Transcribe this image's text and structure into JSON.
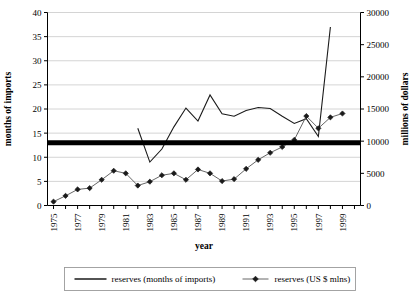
{
  "chart_data": {
    "type": "line",
    "title": "",
    "xlabel": "year",
    "ylabel_left": "months of imports",
    "ylabel_right": "millions of dollars",
    "grid": true,
    "legend_position": "bottom",
    "x": [
      1975,
      1976,
      1977,
      1978,
      1979,
      1980,
      1981,
      1982,
      1983,
      1984,
      1985,
      1986,
      1987,
      1988,
      1989,
      1990,
      1991,
      1992,
      1993,
      1994,
      1995,
      1996,
      1997,
      1998,
      1999
    ],
    "xlim": [
      1974.5,
      2000.5
    ],
    "xticks": [
      1975,
      1976,
      1977,
      1978,
      1979,
      1980,
      1981,
      1982,
      1983,
      1984,
      1985,
      1986,
      1987,
      1988,
      1989,
      1990,
      1991,
      1992,
      1993,
      1994,
      1995,
      1996,
      1997,
      1998,
      1999,
      2000
    ],
    "xticklabels": [
      "1975",
      "",
      "1977",
      "",
      "1979",
      "",
      "1981",
      "",
      "1983",
      "",
      "1985",
      "",
      "1987",
      "",
      "1989",
      "",
      "1991",
      "",
      "1993",
      "",
      "1995",
      "",
      "1997",
      "",
      "1999",
      ""
    ],
    "ylim_left": [
      0,
      40
    ],
    "yticks_left": [
      0,
      5,
      10,
      15,
      20,
      25,
      30,
      35,
      40
    ],
    "ylim_right": [
      0,
      30000
    ],
    "yticks_right": [
      0,
      5000,
      10000,
      15000,
      20000,
      25000,
      30000
    ],
    "series": [
      {
        "name": "reserves (months of imports)",
        "axis": "left",
        "style": "plain-line",
        "color": "#1a1a1a",
        "x": [
          1982,
          1983,
          1984,
          1985,
          1986,
          1987,
          1988,
          1989,
          1990,
          1991,
          1992,
          1993,
          1994,
          1995,
          1996,
          1997,
          1998
        ],
        "values": [
          16.0,
          9.0,
          11.7,
          16.3,
          20.2,
          17.5,
          22.9,
          19.0,
          18.5,
          19.7,
          20.3,
          20.1,
          18.5,
          17.0,
          18.0,
          14.3,
          37.0
        ]
      },
      {
        "name": "reserves (US $ mlns)",
        "axis": "right",
        "style": "marker-line",
        "color": "#555555",
        "x": [
          1975,
          1976,
          1977,
          1978,
          1979,
          1980,
          1981,
          1982,
          1983,
          1984,
          1985,
          1986,
          1987,
          1988,
          1989,
          1990,
          1991,
          1992,
          1993,
          1994,
          1995,
          1996,
          1997,
          1998,
          1999
        ],
        "values": [
          600,
          1500,
          2500,
          2700,
          4000,
          5400,
          5000,
          3100,
          3700,
          4700,
          5000,
          4000,
          5600,
          5000,
          3800,
          4100,
          5700,
          7100,
          8200,
          9100,
          10200,
          13900,
          12000,
          13700,
          14300
        ]
      }
    ],
    "reference_line": {
      "name": "thick-black-rule",
      "axis": "left",
      "value": 13.0,
      "color": "#000000",
      "thickness": 5
    },
    "legend": [
      {
        "label": "reserves (months of imports)",
        "marker": "line"
      },
      {
        "label": "reserves (US $ mlns)",
        "marker": "line-diamond"
      }
    ]
  }
}
